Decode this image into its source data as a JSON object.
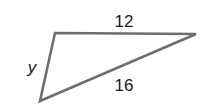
{
  "diagram": {
    "type": "triangle",
    "vertices": {
      "top_left": [
        55,
        33
      ],
      "right": [
        196,
        34
      ],
      "bottom_left": [
        40,
        101
      ]
    },
    "sides": {
      "top": {
        "label": "12"
      },
      "hypotenuse": {
        "label": "16"
      },
      "left": {
        "label": "y"
      }
    },
    "stroke_color": "#6e6e6e"
  }
}
